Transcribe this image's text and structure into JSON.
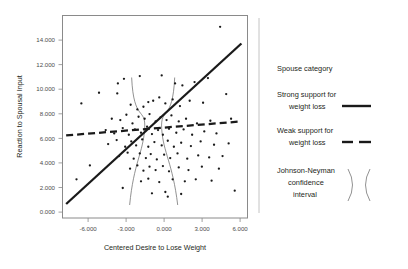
{
  "chart_data": {
    "type": "scatter",
    "title": "",
    "xlabel": "Centered Desire to Lose Weight",
    "ylabel": "Reaction to Spousal Input",
    "xlim": [
      -7.6,
      7.6
    ],
    "ylim": [
      0,
      15200
    ],
    "xticks": [
      "-6.000",
      "-3.000",
      "0.000",
      "3.000",
      "6.000"
    ],
    "xtick_values": [
      -6,
      -3,
      0,
      3,
      6
    ],
    "yticks": [
      "0.000",
      "2.000",
      "4.000",
      "6.000",
      "8.000",
      "10.000",
      "12.000",
      "14.000"
    ],
    "ytick_values": [
      0,
      2000,
      4000,
      6000,
      8000,
      10000,
      12000,
      14000
    ],
    "grid": false,
    "legend_position": "right",
    "series": [
      {
        "name": "Strong support for weight loss",
        "type": "line",
        "style": "solid",
        "x": [
          -7.3,
          7.1
        ],
        "y": [
          1050,
          13100
        ]
      },
      {
        "name": "Weak support for weight loss",
        "type": "line",
        "style": "dashed",
        "x": [
          -7.3,
          7.1
        ],
        "y": [
          6200,
          7250
        ]
      },
      {
        "name": "Johnson-Neyman confidence interval",
        "type": "band",
        "left_bound_x": -0.85,
        "right_bound_x": 0.55,
        "note": "two outward-flaring arcs forming an hourglass about the crossing point"
      }
    ],
    "scatter_points": [
      [
        -6.05,
        8600
      ],
      [
        -4.6,
        9400
      ],
      [
        -3.05,
        10100
      ],
      [
        -3.1,
        9350
      ],
      [
        -2.55,
        10450
      ],
      [
        -1.25,
        10650
      ],
      [
        0.55,
        10700
      ],
      [
        1.65,
        10100
      ],
      [
        2.25,
        9950
      ],
      [
        5.35,
        14350
      ],
      [
        4.35,
        10500
      ],
      [
        3.25,
        10200
      ],
      [
        -2.0,
        8500
      ],
      [
        -1.45,
        8150
      ],
      [
        -0.95,
        8350
      ],
      [
        -0.55,
        8700
      ],
      [
        -0.15,
        8800
      ],
      [
        0.35,
        9050
      ],
      [
        0.85,
        8600
      ],
      [
        1.45,
        8900
      ],
      [
        2.05,
        8400
      ],
      [
        2.85,
        8800
      ],
      [
        3.95,
        8650
      ],
      [
        5.85,
        9300
      ],
      [
        -3.55,
        7450
      ],
      [
        -2.85,
        7350
      ],
      [
        -2.35,
        7750
      ],
      [
        -1.85,
        7100
      ],
      [
        -1.35,
        7600
      ],
      [
        -0.85,
        7450
      ],
      [
        -0.45,
        7800
      ],
      [
        0.05,
        7250
      ],
      [
        0.45,
        7550
      ],
      [
        0.95,
        7350
      ],
      [
        1.35,
        7700
      ],
      [
        1.95,
        7250
      ],
      [
        2.55,
        7450
      ],
      [
        3.45,
        7100
      ],
      [
        4.55,
        7300
      ],
      [
        6.25,
        7450
      ],
      [
        -4.05,
        6600
      ],
      [
        -3.35,
        6350
      ],
      [
        -2.65,
        6750
      ],
      [
        -2.15,
        6250
      ],
      [
        -1.65,
        6650
      ],
      [
        -1.15,
        6400
      ],
      [
        -0.65,
        6850
      ],
      [
        -0.25,
        6300
      ],
      [
        0.25,
        6600
      ],
      [
        0.65,
        6250
      ],
      [
        1.15,
        6700
      ],
      [
        1.75,
        6400
      ],
      [
        2.35,
        6650
      ],
      [
        3.05,
        6250
      ],
      [
        4.05,
        6500
      ],
      [
        5.05,
        6350
      ],
      [
        -3.85,
        5550
      ],
      [
        -3.15,
        5850
      ],
      [
        -2.45,
        5350
      ],
      [
        -1.95,
        5750
      ],
      [
        -1.55,
        5450
      ],
      [
        -1.05,
        5900
      ],
      [
        -0.55,
        5350
      ],
      [
        -0.05,
        5700
      ],
      [
        0.55,
        5450
      ],
      [
        1.05,
        5800
      ],
      [
        1.55,
        5350
      ],
      [
        2.15,
        5650
      ],
      [
        2.95,
        5400
      ],
      [
        3.75,
        5750
      ],
      [
        4.85,
        5500
      ],
      [
        6.05,
        5600
      ],
      [
        -2.95,
        4650
      ],
      [
        -2.25,
        4900
      ],
      [
        -1.75,
        4450
      ],
      [
        -1.25,
        4850
      ],
      [
        -0.75,
        4500
      ],
      [
        -0.35,
        4800
      ],
      [
        0.15,
        4400
      ],
      [
        0.75,
        4750
      ],
      [
        1.25,
        4500
      ],
      [
        1.85,
        4850
      ],
      [
        2.65,
        4450
      ],
      [
        3.55,
        4700
      ],
      [
        4.45,
        4550
      ],
      [
        5.55,
        4650
      ],
      [
        -5.35,
        3950
      ],
      [
        -2.05,
        3700
      ],
      [
        -1.45,
        3950
      ],
      [
        -0.95,
        3550
      ],
      [
        -0.45,
        3850
      ],
      [
        0.05,
        3600
      ],
      [
        0.65,
        3900
      ],
      [
        1.15,
        3500
      ],
      [
        1.95,
        3800
      ],
      [
        2.75,
        3600
      ],
      [
        3.85,
        3850
      ],
      [
        5.25,
        3700
      ],
      [
        -6.45,
        2900
      ],
      [
        -1.15,
        2750
      ],
      [
        -0.55,
        2950
      ],
      [
        0.35,
        2700
      ],
      [
        1.45,
        2900
      ],
      [
        2.45,
        2750
      ],
      [
        3.35,
        2900
      ],
      [
        4.65,
        2800
      ],
      [
        -0.25,
        1850
      ],
      [
        0.85,
        1950
      ],
      [
        2.15,
        1800
      ],
      [
        6.55,
        2050
      ],
      [
        -2.65,
        2250
      ],
      [
        1.05,
        1600
      ]
    ]
  },
  "legend": {
    "header": "Spouse category",
    "items": [
      {
        "label_line1": "Strong support for",
        "label_line2": "weight loss",
        "symbol": "solid-line-swatch"
      },
      {
        "label_line1": "Weak support for",
        "label_line2": "weight loss",
        "symbol": "dashed-line-swatch"
      },
      {
        "label_line1": "Johnson-Neyman",
        "label_line2": "confidence",
        "label_line3": "interval",
        "symbol": "jn-arcs-swatch"
      }
    ]
  },
  "colors": {
    "ink": "#1a1a1a",
    "frame": "#8a8a8a",
    "curve": "#6e6e6e",
    "tick_text": "#4b4b4b",
    "background": "#ffffff"
  }
}
